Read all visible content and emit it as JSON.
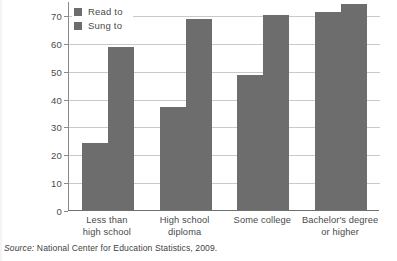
{
  "chart_data": {
    "type": "bar",
    "title": "",
    "subtitle": "",
    "xlabel": "",
    "ylabel": "",
    "categories": [
      "Less than\nhigh school",
      "High school\ndiploma",
      "Some college",
      "Bachelor's degree\nor higher"
    ],
    "category_lines": [
      [
        "Less than",
        "high school"
      ],
      [
        "High school",
        "diploma"
      ],
      [
        "Some college",
        ""
      ],
      [
        "Bachelor's degree",
        "or higher"
      ]
    ],
    "series": [
      {
        "name": "Read to",
        "values": [
          24,
          37,
          48.5,
          71
        ]
      },
      {
        "name": "Sung to",
        "values": [
          58.5,
          68.5,
          70,
          74
        ]
      }
    ],
    "ylim": [
      0,
      75
    ],
    "yticks": [
      0,
      10,
      20,
      30,
      40,
      50,
      60,
      70
    ],
    "ytick_labels": [
      "0",
      "10",
      "20",
      "30",
      "40",
      "50",
      "60",
      "70"
    ],
    "grid": true,
    "legend_position": "top-left-inside",
    "bar_color": "#6d6d6d",
    "gridline_color": "#c9c9c9",
    "axis_color": "#8a8a8a"
  },
  "legend": {
    "items": [
      {
        "label": "Read to"
      },
      {
        "label": "Sung to"
      }
    ]
  },
  "source": {
    "label": "Source:",
    "text": "National Center for Education Statistics, 2009."
  }
}
